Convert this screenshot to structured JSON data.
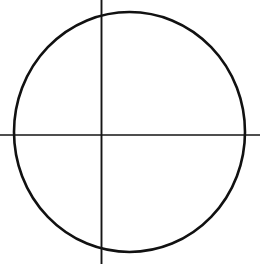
{
  "figure": {
    "background_color": "#ffffff",
    "stroke_color": "#111111",
    "canvas": {
      "width": 260,
      "height": 264
    }
  },
  "chart_data": {
    "type": "scatter",
    "xlabel": "",
    "ylabel": "",
    "grid": false,
    "legend_position": "none",
    "xlim": [
      0,
      260
    ],
    "ylim": [
      0,
      264
    ],
    "categories": [],
    "values": [],
    "annotations": [
      {
        "name": "circle",
        "shape": "ellipse",
        "center_x": 129.5,
        "center_y": 132,
        "radius_x": 115.5,
        "radius_y": 120,
        "stroke_width": 2.6,
        "stroke_color": "#111111",
        "fill": "none"
      },
      {
        "name": "vertical-axis",
        "shape": "line",
        "x1": 101.5,
        "y1": 0,
        "x2": 101.5,
        "y2": 264,
        "stroke_width": 1.9,
        "stroke_color": "#151515"
      },
      {
        "name": "horizontal-axis",
        "shape": "line",
        "x1": 0,
        "y1": 135,
        "x2": 260,
        "y2": 135,
        "stroke_width": 1.5,
        "stroke_color": "#151515"
      }
    ],
    "intersection_point": {
      "x": 101.5,
      "y": 135
    }
  }
}
